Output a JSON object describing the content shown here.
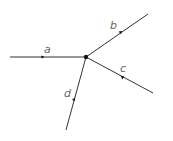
{
  "diagram": {
    "node": {
      "x": 86,
      "y": 57
    },
    "branches": [
      {
        "id": "a",
        "label": "a",
        "end": [
          10,
          57
        ],
        "label_pos": [
          44,
          53
        ],
        "arrow": [
          43,
          57
        ],
        "direction": "in"
      },
      {
        "id": "b",
        "label": "b",
        "end": [
          148,
          14
        ],
        "label_pos": [
          110,
          29
        ],
        "arrow": [
          121,
          32
        ],
        "direction": "out"
      },
      {
        "id": "c",
        "label": "c",
        "end": [
          153,
          93
        ],
        "label_pos": [
          120,
          72
        ],
        "arrow": [
          122,
          77
        ],
        "direction": "in"
      },
      {
        "id": "d",
        "label": "d",
        "end": [
          66,
          130
        ],
        "label_pos": [
          64,
          97
        ],
        "arrow": [
          74,
          99
        ],
        "direction": "in"
      }
    ],
    "colors": {
      "line": "#333333",
      "label": "#666666"
    }
  }
}
